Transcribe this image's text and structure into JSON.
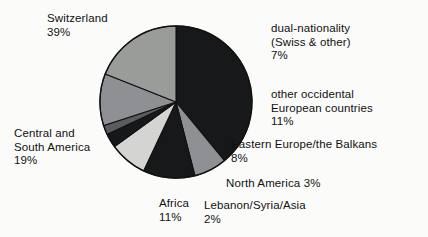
{
  "chart_data": {
    "type": "pie",
    "title": "",
    "subtitle": "",
    "xlabel": "",
    "ylabel": "",
    "legend_position": "callout-labels",
    "grid": false,
    "start_angle_deg": 0,
    "direction": "clockwise",
    "categories": [
      "Switzerland",
      "dual-nationality (Swiss & other)",
      "other occidental European countries",
      "Eastern Europe/the Balkans",
      "North America",
      "Lebanon/Syria/Asia",
      "Africa",
      "Central and South America"
    ],
    "values": [
      39,
      7,
      11,
      8,
      3,
      2,
      11,
      19
    ],
    "unit": "%",
    "slices": [
      {
        "label": "Switzerland",
        "value": 39,
        "percent_text": "39%",
        "color": "#17181a"
      },
      {
        "label": "dual-nationality (Swiss & other)",
        "value": 7,
        "percent_text": "7%",
        "color": "#8e9094"
      },
      {
        "label": "other occidental European countries",
        "value": 11,
        "percent_text": "11%",
        "color": "#17181a"
      },
      {
        "label": "Eastern Europe/the Balkans",
        "value": 8,
        "percent_text": "8%",
        "color": "#d4d5d2"
      },
      {
        "label": "North America",
        "value": 3,
        "percent_text": "3%",
        "color": "#17181a"
      },
      {
        "label": "Lebanon/Syria/Asia",
        "value": 2,
        "percent_text": "2%",
        "color": "#5a5c5f"
      },
      {
        "label": "Africa",
        "value": 11,
        "percent_text": "11%",
        "color": "#8e9094"
      },
      {
        "label": "Central and South America",
        "value": 19,
        "percent_text": "19%",
        "color": "#9a9c99"
      }
    ],
    "annotations": [
      {
        "name": "switzerland",
        "line1": "Switzerland",
        "line2": "39%",
        "line3": ""
      },
      {
        "name": "dual",
        "line1": "dual-nationality",
        "line2": "(Swiss & other)",
        "line3": "7%"
      },
      {
        "name": "occidental",
        "line1": "other occidental",
        "line2": "European countries",
        "line3": "11%"
      },
      {
        "name": "eastern",
        "line1": "Eastern Europe/the Balkans",
        "line2": "8%",
        "line3": ""
      },
      {
        "name": "northamerica",
        "line1": "North America 3%",
        "line2": "",
        "line3": ""
      },
      {
        "name": "lebanon",
        "line1": "Lebanon/Syria/Asia",
        "line2": "2%",
        "line3": ""
      },
      {
        "name": "africa",
        "line1": "Africa",
        "line2": "11%",
        "line3": ""
      },
      {
        "name": "central",
        "line1": "Central and",
        "line2": "South America",
        "line3": "19%"
      }
    ],
    "geometry": {
      "center_x": 176,
      "center_y": 102,
      "radius": 76,
      "outline_color": "#111111",
      "background": "#fbfbfa"
    }
  }
}
